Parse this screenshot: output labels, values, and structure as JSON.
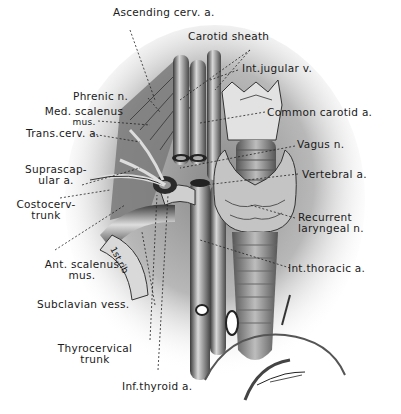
{
  "figure": {
    "labels": [
      {
        "id": "ascending-cervical-artery",
        "text": "Ascending cerv. a."
      },
      {
        "id": "carotid-sheath",
        "text": "Carotid sheath"
      },
      {
        "id": "internal-jugular-vein",
        "text": "Int.jugular v."
      },
      {
        "id": "phrenic-nerve",
        "text": "Phrenic n."
      },
      {
        "id": "medial-scalenus-muscle",
        "text": "Med. scalenus",
        "text2": "mus."
      },
      {
        "id": "common-carotid-artery",
        "text": "Common carotid a."
      },
      {
        "id": "transverse-cervical-artery",
        "text": "Trans.cerv. a."
      },
      {
        "id": "vagus-nerve",
        "text": "Vagus n."
      },
      {
        "id": "suprascapular-artery",
        "text": "Suprascap-",
        "text2": "ular a."
      },
      {
        "id": "vertebral-artery",
        "text": "Vertebral a."
      },
      {
        "id": "costocervical-trunk",
        "text": "Costocerv-",
        "text2": "trunk"
      },
      {
        "id": "recurrent-laryngeal-nerve",
        "text": "Recurrent",
        "text2": "laryngeal n."
      },
      {
        "id": "anterior-scalenus-muscle",
        "text": "Ant. scalenus",
        "text2": "mus."
      },
      {
        "id": "internal-thoracic-artery",
        "text": "Int.thoracic a."
      },
      {
        "id": "subclavian-vessels",
        "text": "Subclavian vess."
      },
      {
        "id": "thyrocervical-trunk",
        "text": "Thyrocervical",
        "text2": "trunk"
      },
      {
        "id": "inferior-thyroid-artery",
        "text": "Inf.thyroid a."
      }
    ],
    "structure_labels": {
      "first_rib": "1st.rib"
    },
    "signature": "artist signature"
  }
}
